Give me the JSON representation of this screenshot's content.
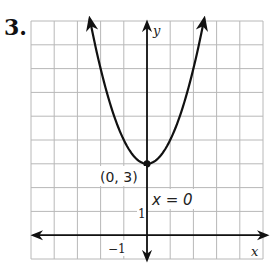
{
  "problem": {
    "number": "3."
  },
  "chart_data": {
    "type": "line",
    "title": "",
    "function": "y = x^2 + 3",
    "xlabel": "x",
    "ylabel": "y",
    "xlim": [
      -5,
      5
    ],
    "ylim": [
      -1,
      9
    ],
    "grid": true,
    "tick_labels": {
      "x": [
        "-1"
      ],
      "y": [
        "1"
      ]
    },
    "series": [
      {
        "name": "parabola",
        "x": [
          -2.5,
          -2,
          -1.5,
          -1,
          -0.5,
          0,
          0.5,
          1,
          1.5,
          2,
          2.5
        ],
        "y": [
          9.25,
          7,
          5.25,
          4,
          3.25,
          3,
          3.25,
          4,
          5.25,
          7,
          9.25
        ]
      }
    ],
    "annotations": [
      {
        "text": "(0, 3)",
        "x": 0,
        "y": 3,
        "type": "vertex-point"
      },
      {
        "text": "x = 0",
        "type": "axis-of-symmetry-label"
      }
    ]
  },
  "labels": {
    "vertex": "(0, 3)",
    "axis_of_symmetry": "x = 0",
    "x_axis": "x",
    "y_axis": "y",
    "x_tick": "−1",
    "y_tick": "1"
  },
  "colors": {
    "grid": "#b8b8b8",
    "axis": "#111111",
    "curve": "#111111"
  }
}
